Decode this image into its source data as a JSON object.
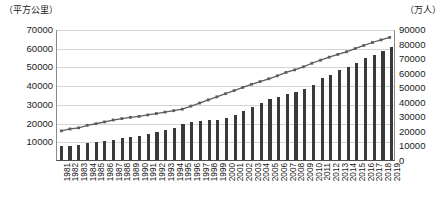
{
  "chart_data": {
    "type": "bar",
    "title": "",
    "subtitle": "",
    "xlabel": "",
    "ylabel": "（平方公里）",
    "y2label": "（万人）",
    "grid": true,
    "legend_position": "none",
    "ylim": [
      0,
      70000
    ],
    "y2lim": [
      0,
      90000
    ],
    "yticks": [
      70000,
      60000,
      50000,
      40000,
      30000,
      20000,
      10000
    ],
    "y2ticks": [
      90000,
      80000,
      70000,
      60000,
      50000,
      40000,
      30000,
      20000,
      10000,
      0
    ],
    "categories": [
      "1981",
      "1982",
      "1983",
      "1984",
      "1985",
      "1986",
      "1987",
      "1988",
      "1989",
      "1990",
      "1991",
      "1992",
      "1993",
      "1994",
      "1995",
      "1996",
      "1997",
      "1998",
      "1999",
      "2000",
      "2001",
      "2002",
      "2003",
      "2004",
      "2005",
      "2006",
      "2007",
      "2008",
      "2009",
      "2010",
      "2011",
      "2012",
      "2013",
      "2014",
      "2015",
      "2016",
      "2017",
      "2018",
      "2019"
    ],
    "series": [
      {
        "name": "城市建成区面积",
        "render": "bar",
        "axis": "left",
        "unit": "平方公里",
        "color": "#3a3a3a",
        "values": [
          7438,
          7563,
          8156,
          8842,
          9386,
          10127,
          10816,
          11608,
          12462,
          12856,
          14011,
          14958,
          15908,
          17093,
          19264,
          20214,
          20791,
          21380,
          21525,
          22439,
          24027,
          25973,
          28308,
          30406,
          32521,
          33660,
          35470,
          36295,
          38107,
          40058,
          43603,
          45566,
          47855,
          49773,
          52102,
          54332,
          56225,
          58456,
          60312
        ]
      },
      {
        "name": "城镇人口",
        "render": "line",
        "axis": "right",
        "unit": "万人",
        "color": "#5c5c5c",
        "marker": "square",
        "values": [
          20171,
          21480,
          22274,
          24017,
          25094,
          26366,
          27674,
          28661,
          29540,
          30195,
          31203,
          32175,
          33173,
          34169,
          35174,
          37304,
          39449,
          41608,
          43748,
          45906,
          48064,
          50212,
          52376,
          54283,
          56212,
          58288,
          60633,
          62403,
          64512,
          66978,
          69079,
          71182,
          73111,
          74916,
          77116,
          79298,
          81347,
          83137,
          84843
        ]
      }
    ]
  },
  "axes": {
    "left_unit_label": "（平方公里）",
    "right_unit_label": "（万人）"
  }
}
